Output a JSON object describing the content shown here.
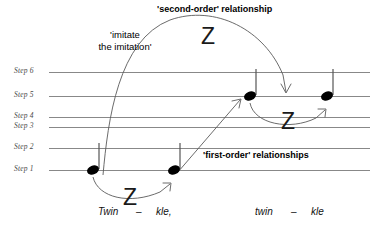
{
  "figure": {
    "type": "music-imitation-diagram",
    "background_color": "#ffffff",
    "staff_line_color": "#888888",
    "note_color": "#000000",
    "arrow_color": "#5a5a5a"
  },
  "steps": [
    {
      "label": "Step 6",
      "y": 72
    },
    {
      "label": "Step 5",
      "y": 96
    },
    {
      "label": "Step 4",
      "y": 117
    },
    {
      "label": "Step 3",
      "y": 127
    },
    {
      "label": "Step 2",
      "y": 148
    },
    {
      "label": "Step 1",
      "y": 170
    }
  ],
  "notes": [
    {
      "name": "note-1",
      "step": "Step 1",
      "x": 93,
      "y": 170
    },
    {
      "name": "note-2",
      "step": "Step 1",
      "x": 174,
      "y": 170
    },
    {
      "name": "note-3",
      "step": "Step 5",
      "x": 250,
      "y": 96
    },
    {
      "name": "note-4",
      "step": "Step 5",
      "x": 327,
      "y": 96
    }
  ],
  "lyrics": [
    {
      "text": "Twin",
      "x": 98,
      "y": 211
    },
    {
      "text": "–",
      "x": 136,
      "y": 211
    },
    {
      "text": "kle,",
      "x": 156,
      "y": 211
    },
    {
      "text": "twin",
      "x": 255,
      "y": 211
    },
    {
      "text": "–",
      "x": 291,
      "y": 211
    },
    {
      "text": "kle",
      "x": 311,
      "y": 211
    }
  ],
  "annotations": {
    "second_order": {
      "label": "'second-order' relationship",
      "x": 157,
      "y": 4,
      "weight": "bold"
    },
    "imitate": {
      "line1": "'imitate",
      "line2": "the imitation'",
      "x": 87,
      "y": 30,
      "weight": "regular"
    },
    "first_order": {
      "label": "'first-order' relationships",
      "x": 203,
      "y": 150,
      "weight": "bold"
    }
  },
  "z_marks": [
    {
      "name": "z-first-order-left",
      "glyph": "Z",
      "x": 123,
      "y": 186
    },
    {
      "name": "z-second-order",
      "glyph": "Z",
      "x": 201,
      "y": 25
    },
    {
      "name": "z-first-order-right",
      "glyph": "Z",
      "x": 281,
      "y": 110
    }
  ],
  "arrows": [
    {
      "name": "first-order-arrow-left",
      "from_note": "note-1",
      "to_note": "note-2",
      "shape": "arc-below"
    },
    {
      "name": "first-order-arrow-right",
      "from_note": "note-3",
      "to_note": "note-4",
      "shape": "arc-below"
    },
    {
      "name": "second-order-arrow",
      "from_note": "note-1",
      "to_note": "note-4",
      "shape": "tall-arc"
    },
    {
      "name": "imitation-diagonal-arrow",
      "from_note": "note-2",
      "to_note": "note-3",
      "shape": "straight-diagonal"
    }
  ]
}
